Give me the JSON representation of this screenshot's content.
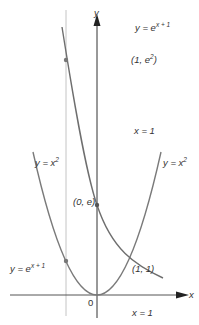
{
  "diagram": {
    "axes": {
      "x_label": "x",
      "y_label": "y",
      "origin_label": "0"
    },
    "curves": [
      {
        "name": "parabola",
        "label_left": "y = x",
        "label_right": "y = x",
        "exponent": "2"
      },
      {
        "name": "exponential",
        "label_top": "y = e",
        "label_bottom": "y = e",
        "exponent": "x + 1"
      }
    ],
    "points": [
      {
        "label": "(1, e",
        "exponent": "2",
        "suffix": ")"
      },
      {
        "label": "(0, e)"
      },
      {
        "label": "(1, 1)"
      }
    ],
    "vertical_line_labels": {
      "upper": "x = 1",
      "lower": "x = 1"
    },
    "colors": {
      "curve": "#777777",
      "axis": "#222222",
      "guide_line": "#bbbbbb"
    }
  }
}
